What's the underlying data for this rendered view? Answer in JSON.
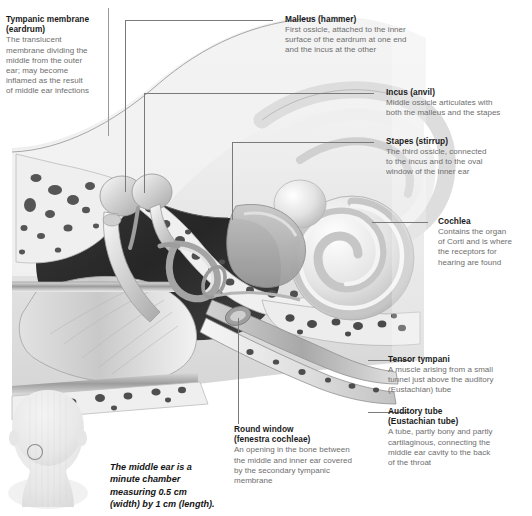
{
  "figure": {
    "caption": "The middle ear is a\nminute chamber\nmeasuring 0.5 cm\n(width) by 1 cm (length).",
    "colors": {
      "heading": "#1a1a1a",
      "body": "#6e6e6e",
      "leader": "#7a7a7a",
      "background": "#ffffff",
      "bone_light": "#e9e9e9",
      "cavity_dark": "#2a2a2a"
    }
  },
  "callouts": [
    {
      "id": "tympanic-membrane",
      "title": "Tympanic membrane\n(eardrum)",
      "body": "The translucent\nmembrane dividing the\nmiddle from the outer\near; may become\ninflamed as the result\nof middle ear infections"
    },
    {
      "id": "malleus",
      "title": "Malleus (hammer)",
      "body": "First ossicle, attached to the inner\nsurface of the eardrum at one end\nand the incus at the other"
    },
    {
      "id": "incus",
      "title": "Incus (anvil)",
      "body": "Middle ossicle articulates with\nboth the malleus and the stapes"
    },
    {
      "id": "stapes",
      "title": "Stapes (stirrup)",
      "body": "The third ossicle, connected\nto the incus and to the oval\nwindow of the inner ear"
    },
    {
      "id": "cochlea",
      "title": "Cochlea",
      "body": "Contains the organ\nof Corti and is where\nthe receptors for\nhearing are found"
    },
    {
      "id": "tensor-tympani",
      "title": "Tensor tympani",
      "body": "A muscle arising from a small\ntunnel just above the auditory\n(Eustachian) tube"
    },
    {
      "id": "auditory-tube",
      "title": "Auditory tube\n(Eustachian tube)",
      "body": "A tube, partly bony and partly\ncartilaginous, connecting the\nmiddle ear cavity to the back\nof the throat"
    },
    {
      "id": "round-window",
      "title": "Round window\n(fenestra cochleae)",
      "body": "An opening in the bone between\nthe middle and inner ear covered\nby the secondary tympanic\nmembrane"
    }
  ],
  "inset": {
    "id": "head-inset",
    "label": "head-with-ear-location-marker"
  }
}
